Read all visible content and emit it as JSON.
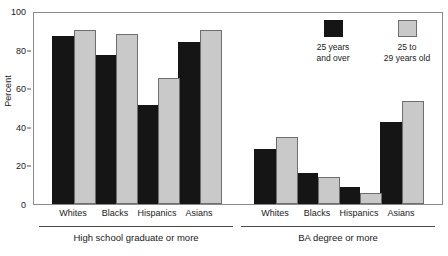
{
  "chart_data": {
    "type": "bar",
    "title": "",
    "subtitle": "",
    "xlabel": "",
    "ylabel": "Percent",
    "ylim": [
      0,
      100
    ],
    "yticks": [
      0,
      20,
      40,
      60,
      80,
      100
    ],
    "ytick_labels": [
      "0",
      "20",
      "40",
      "60",
      "80",
      "100"
    ],
    "grid": false,
    "legend_position": "top-right",
    "categories": [
      "Whites",
      "Blacks",
      "Hispanics",
      "Asians",
      "Whites",
      "Blacks",
      "Hispanics",
      "Asians"
    ],
    "groups": [
      {
        "name": "High school graduate or more",
        "categories": [
          "Whites",
          "Blacks",
          "Hispanics",
          "Asians"
        ]
      },
      {
        "name": "BA degree or more",
        "categories": [
          "Whites",
          "Blacks",
          "Hispanics",
          "Asians"
        ]
      }
    ],
    "series": [
      {
        "name": "25 years and over",
        "color": "#151515",
        "values": [
          88,
          78,
          52,
          85,
          29,
          16,
          9,
          43
        ],
        "by_group": {
          "High school graduate or more": [
            88,
            78,
            52,
            85
          ],
          "BA degree or more": [
            29,
            16,
            9,
            43
          ]
        }
      },
      {
        "name": "25 to 29 years old",
        "color": "#c9c9c9",
        "values": [
          91,
          89,
          66,
          91,
          35,
          14,
          6,
          54
        ],
        "by_group": {
          "High school graduate or more": [
            91,
            89,
            66,
            91
          ],
          "BA degree or more": [
            35,
            14,
            6,
            54
          ]
        }
      }
    ]
  },
  "legend": {
    "entries": [
      {
        "label": "25 years\nand over",
        "swatch": "dark-swatch",
        "color": "#151515"
      },
      {
        "label": "25 to\n29 years old",
        "swatch": "light-swatch",
        "color": "#c9c9c9"
      }
    ]
  },
  "axis": {
    "y_title": "Percent",
    "y_tick_labels": [
      "100",
      "80",
      "60",
      "40",
      "20",
      "0"
    ]
  },
  "group_titles": [
    "High school graduate or more",
    "BA degree or more"
  ],
  "colors": {
    "series_dark": "#151515",
    "series_light": "#c9c9c9",
    "frame": "#8a8a8a",
    "text": "#1a1a1a",
    "background": "#ffffff"
  }
}
